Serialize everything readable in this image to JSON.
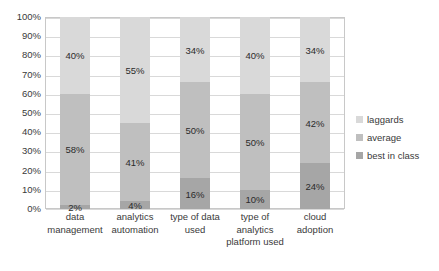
{
  "chart_data": {
    "type": "bar",
    "subtype": "stacked-bar-100-percent",
    "title": "",
    "subtitle": "",
    "xlabel": "",
    "ylabel": "",
    "ylim": [
      0,
      100
    ],
    "ytick_labels": [
      "100%",
      "90%",
      "80%",
      "70%",
      "60%",
      "50%",
      "40%",
      "30%",
      "20%",
      "10%",
      "0%"
    ],
    "ytick_values": [
      100,
      90,
      80,
      70,
      60,
      50,
      40,
      30,
      20,
      10,
      0
    ],
    "grid": true,
    "legend_position": "right",
    "categories": [
      "data management",
      "analytics automation",
      "type of data used",
      "type of analytics platform used",
      "cloud adoption"
    ],
    "category_lines": [
      [
        "data",
        "management"
      ],
      [
        "analytics",
        "automation"
      ],
      [
        "type of data",
        "used"
      ],
      [
        "type of",
        "analytics",
        "platform used"
      ],
      [
        "cloud",
        "adoption"
      ]
    ],
    "series": [
      {
        "name": "best in class",
        "color": "#a6a6a6",
        "values": [
          2,
          4,
          16,
          10,
          24
        ],
        "labels": [
          "2%",
          "4%",
          "16%",
          "10%",
          "24%"
        ]
      },
      {
        "name": "average",
        "color": "#bfbfbf",
        "values": [
          58,
          41,
          50,
          50,
          42
        ],
        "labels": [
          "58%",
          "41%",
          "50%",
          "50%",
          "42%"
        ]
      },
      {
        "name": "laggards",
        "color": "#d9d9d9",
        "values": [
          40,
          55,
          34,
          40,
          34
        ],
        "labels": [
          "40%",
          "55%",
          "34%",
          "40%",
          "34%"
        ]
      }
    ]
  },
  "legend": {
    "items": [
      {
        "label": "laggards",
        "color": "#d9d9d9"
      },
      {
        "label": "average",
        "color": "#bfbfbf"
      },
      {
        "label": "best in class",
        "color": "#a6a6a6"
      }
    ]
  },
  "colors": {
    "laggards": "#d9d9d9",
    "average": "#bfbfbf",
    "best_in_class": "#a6a6a6",
    "gridline": "#d9d9d9",
    "plot_border": "#c8c8c8",
    "text": "#3a3a3a",
    "background": "#ffffff"
  }
}
